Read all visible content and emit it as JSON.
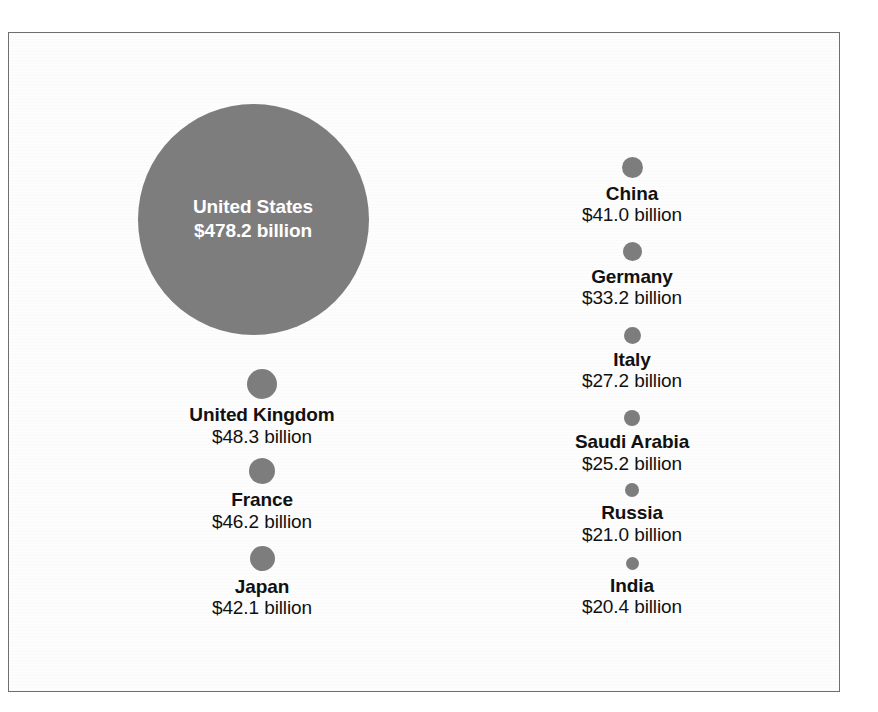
{
  "chart_data": {
    "type": "bubble",
    "title": "",
    "xlabel": "",
    "ylabel": "",
    "value_unit": "billion USD",
    "legend": "none",
    "grid": false,
    "bubble_color": "#7d7d7d",
    "inside_label_color": "#ffffff",
    "label_color": "#111111",
    "categories": [
      "United States",
      "United Kingdom",
      "France",
      "Japan",
      "China",
      "Germany",
      "Italy",
      "Saudi Arabia",
      "Russia",
      "India"
    ],
    "values": [
      478.2,
      48.3,
      46.2,
      42.1,
      41.0,
      33.2,
      27.2,
      25.2,
      21.0,
      20.4
    ],
    "points": [
      {
        "label": "United States",
        "value": 478.2,
        "value_text": "$478.2 billion",
        "diameter_px": 231,
        "label_inside": true,
        "column": "left",
        "cx": 252,
        "cy": 218
      },
      {
        "label": "United Kingdom",
        "value": 48.3,
        "value_text": "$48.3 billion",
        "diameter_px": 30,
        "label_inside": false,
        "column": "left",
        "cx": 261,
        "cy": 383
      },
      {
        "label": "France",
        "value": 46.2,
        "value_text": "$46.2 billion",
        "diameter_px": 26,
        "label_inside": false,
        "column": "left",
        "cx": 261,
        "cy": 470
      },
      {
        "label": "Japan",
        "value": 42.1,
        "value_text": "$42.1 billion",
        "diameter_px": 25,
        "label_inside": false,
        "column": "left",
        "cx": 261,
        "cy": 557
      },
      {
        "label": "China",
        "value": 41.0,
        "value_text": "$41.0 billion",
        "diameter_px": 21,
        "label_inside": false,
        "column": "right",
        "cx": 631,
        "cy": 166
      },
      {
        "label": "Germany",
        "value": 33.2,
        "value_text": "$33.2 billion",
        "diameter_px": 19,
        "label_inside": false,
        "column": "right",
        "cx": 631,
        "cy": 250
      },
      {
        "label": "Italy",
        "value": 27.2,
        "value_text": "$27.2 billion",
        "diameter_px": 17,
        "label_inside": false,
        "column": "right",
        "cx": 631,
        "cy": 334
      },
      {
        "label": "Saudi Arabia",
        "value": 25.2,
        "value_text": "$25.2 billion",
        "diameter_px": 16,
        "label_inside": false,
        "column": "right",
        "cx": 631,
        "cy": 417
      },
      {
        "label": "Russia",
        "value": 21.0,
        "value_text": "$21.0 billion",
        "diameter_px": 14,
        "label_inside": false,
        "column": "right",
        "cx": 631,
        "cy": 489
      },
      {
        "label": "India",
        "value": 20.4,
        "value_text": "$20.4 billion",
        "diameter_px": 13,
        "label_inside": false,
        "column": "right",
        "cx": 631,
        "cy": 562
      }
    ]
  }
}
